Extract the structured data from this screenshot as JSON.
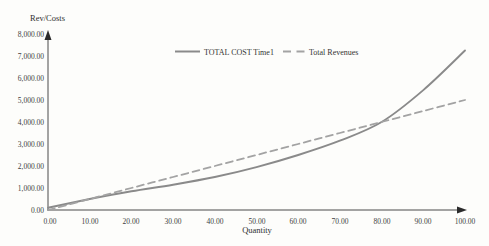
{
  "chart_data": {
    "type": "line",
    "title": "",
    "ylabel": "Rev/Costs",
    "xlabel": "Quantity",
    "x": [
      0,
      10,
      20,
      30,
      40,
      50,
      60,
      70,
      80,
      90,
      100
    ],
    "series": [
      {
        "name": "TOTAL COST Time1",
        "style": "solid",
        "color": "#8a8a8a",
        "values": [
          100,
          500,
          850,
          1150,
          1500,
          1950,
          2500,
          3150,
          4000,
          5450,
          7250
        ]
      },
      {
        "name": "Total Revenues",
        "style": "dashed",
        "color": "#a3a3a3",
        "values": [
          0,
          500,
          1000,
          1500,
          2000,
          2500,
          3000,
          3500,
          4000,
          4500,
          5000
        ]
      }
    ],
    "xlim": [
      0,
      100
    ],
    "ylim": [
      0,
      8000
    ],
    "x_tick_labels": [
      "0.00",
      "10.00",
      "20.00",
      "30.00",
      "40.00",
      "50.00",
      "60.00",
      "70.00",
      "80.00",
      "90.00",
      "100.00"
    ],
    "y_tick_labels": [
      "0.00",
      "1,000.00",
      "2,000.00",
      "3,000.00",
      "4,000.00",
      "5,000.00",
      "6,000.00",
      "7,000.00",
      "8,000.00"
    ],
    "grid": false,
    "legend_position": "top-center",
    "axis_color": "#4a4a4a",
    "background_color": "#fdfdfb"
  }
}
